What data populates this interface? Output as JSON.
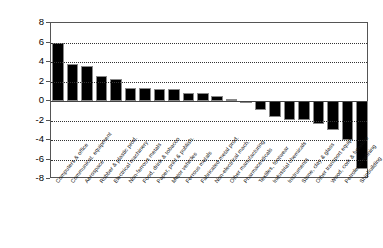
{
  "chart_data": {
    "type": "bar",
    "title": "",
    "subtitle": "",
    "xlabel": "",
    "ylabel": "",
    "ylim": [
      -8,
      8
    ],
    "grid": true,
    "legend": "none",
    "orientation": "vertical",
    "bar_color": "#000000",
    "yticks": [
      8,
      6,
      4,
      2,
      0,
      -2,
      -4,
      -6,
      -8
    ],
    "ytick_labels": [
      "8",
      "6",
      "4",
      "2",
      "0",
      "-2",
      "-4",
      "-6",
      "-8"
    ],
    "gridline_values": [
      6,
      4,
      2,
      -2,
      -4,
      -6
    ],
    "zero_line": 0,
    "categories": [
      "Computers & office",
      "Communicat. equipment",
      "Aerospace",
      "Rubber & plastic prod.",
      "Electrical machinery",
      "Non-ferrous metals",
      "Food, drink & tobacco",
      "Paper, print & publish.",
      "Motor vehicles",
      "Ferrous metals",
      "Fabricated metal prod.",
      "Non-electrical mach.",
      "Other manufacturing",
      "Pharmaceuticals",
      "Textiles, footwear",
      "Industrial chemicals",
      "Instruments",
      "Stone, clay & glass",
      "Other transport equip.",
      "Wood, cork & furniture",
      "Petroleum refining",
      "Shipbuilding"
    ],
    "values": [
      6.0,
      3.8,
      3.6,
      2.55,
      2.3,
      1.35,
      1.35,
      1.25,
      1.25,
      0.8,
      0.8,
      0.55,
      0.2,
      -0.2,
      -0.9,
      -1.6,
      -1.9,
      -1.9,
      -2.4,
      -3.0,
      -4.0,
      -7.0
    ]
  }
}
